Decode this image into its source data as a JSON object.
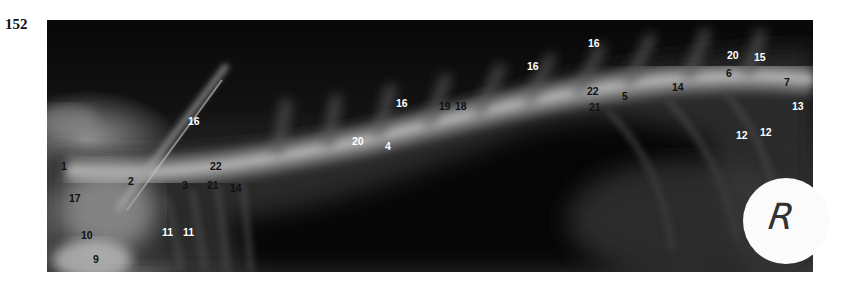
{
  "figure": {
    "number": "152",
    "marker_letter": "R"
  },
  "labels": [
    {
      "text": "1",
      "x": 61,
      "y": 167,
      "color": "black"
    },
    {
      "text": "17",
      "x": 69,
      "y": 199,
      "color": "black"
    },
    {
      "text": "10",
      "x": 81,
      "y": 236,
      "color": "black"
    },
    {
      "text": "9",
      "x": 93,
      "y": 260,
      "color": "black"
    },
    {
      "text": "2",
      "x": 128,
      "y": 182,
      "color": "black"
    },
    {
      "text": "8",
      "x": 163,
      "y": 111,
      "color": "black"
    },
    {
      "text": "16",
      "x": 188,
      "y": 122,
      "color": "white"
    },
    {
      "text": "3",
      "x": 182,
      "y": 186,
      "color": "black"
    },
    {
      "text": "22",
      "x": 210,
      "y": 167,
      "color": "black"
    },
    {
      "text": "21",
      "x": 207,
      "y": 186,
      "color": "black"
    },
    {
      "text": "14",
      "x": 230,
      "y": 189,
      "color": "black"
    },
    {
      "text": "11",
      "x": 162,
      "y": 233,
      "color": "white"
    },
    {
      "text": "11",
      "x": 183,
      "y": 233,
      "color": "white"
    },
    {
      "text": "20",
      "x": 352,
      "y": 142,
      "color": "white"
    },
    {
      "text": "4",
      "x": 385,
      "y": 147,
      "color": "white"
    },
    {
      "text": "16",
      "x": 396,
      "y": 104,
      "color": "white"
    },
    {
      "text": "19",
      "x": 439,
      "y": 107,
      "color": "black"
    },
    {
      "text": "18",
      "x": 455,
      "y": 107,
      "color": "black"
    },
    {
      "text": "16",
      "x": 527,
      "y": 67,
      "color": "white"
    },
    {
      "text": "16",
      "x": 588,
      "y": 44,
      "color": "white"
    },
    {
      "text": "22",
      "x": 587,
      "y": 92,
      "color": "black"
    },
    {
      "text": "21",
      "x": 589,
      "y": 108,
      "color": "black"
    },
    {
      "text": "5",
      "x": 622,
      "y": 97,
      "color": "black"
    },
    {
      "text": "14",
      "x": 672,
      "y": 88,
      "color": "black"
    },
    {
      "text": "20",
      "x": 727,
      "y": 56,
      "color": "white"
    },
    {
      "text": "15",
      "x": 754,
      "y": 58,
      "color": "white"
    },
    {
      "text": "6",
      "x": 726,
      "y": 74,
      "color": "black"
    },
    {
      "text": "7",
      "x": 784,
      "y": 83,
      "color": "black"
    },
    {
      "text": "13",
      "x": 792,
      "y": 107,
      "color": "white"
    },
    {
      "text": "12",
      "x": 736,
      "y": 136,
      "color": "white"
    },
    {
      "text": "12",
      "x": 760,
      "y": 133,
      "color": "white"
    }
  ]
}
